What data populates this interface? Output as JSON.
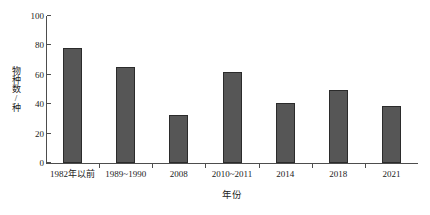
{
  "chart_data": {
    "type": "bar",
    "title": "",
    "xlabel": "年份",
    "ylabel": "物种数/种",
    "categories": [
      "1982年以前",
      "1989~1990",
      "2008",
      "2010~2011",
      "2014",
      "2018",
      "2021"
    ],
    "values": [
      78,
      65,
      33,
      62,
      41,
      50,
      39
    ],
    "ylim": [
      0,
      100
    ],
    "yticks": [
      0,
      20,
      40,
      60,
      80,
      100
    ],
    "ytick_labels": [
      "0",
      "20",
      "40",
      "60",
      "80",
      "100"
    ],
    "grid": false,
    "legend": "none",
    "bar_color": "#565656",
    "bar_edge_color": "#2b2b2b",
    "axis_color": "#4d4d4d"
  }
}
